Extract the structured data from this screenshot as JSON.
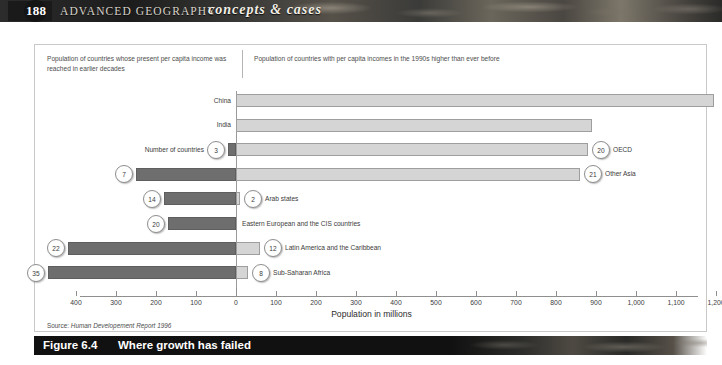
{
  "banner": {
    "page_number": "188",
    "title": "ADVANCED GEOGRAPHY",
    "subtitle": "concepts & cases"
  },
  "figure": {
    "caption_left": "Population of countries whose present per capita income was reached in earlier decades",
    "caption_right": "Population of countries with per capita incomes  in the 1990s higher than ever before",
    "axis_title": "Population in millions",
    "source_prefix": "Source: ",
    "source_title": "Human Developement Report 1996",
    "number_of_countries_label": "Number of countries",
    "fig_number": "Figure 6.4",
    "fig_title": "Where growth has failed"
  },
  "chart_data": {
    "type": "bar",
    "orientation": "horizontal",
    "style": "diverging",
    "title": "Where growth has failed",
    "xlabel": "Population in millions",
    "ylabel": "",
    "xlim": [
      -470,
      1230
    ],
    "xticks": [
      -400,
      -300,
      -200,
      -100,
      0,
      100,
      200,
      300,
      400,
      500,
      600,
      700,
      800,
      900,
      1000,
      1100,
      1200
    ],
    "xticklabels": [
      "400",
      "300",
      "200",
      "100",
      "0",
      "100",
      "200",
      "300",
      "400",
      "500",
      "600",
      "700",
      "800",
      "900",
      "1,000",
      "1,100",
      "1,200"
    ],
    "grid": false,
    "legend": "none",
    "series": [
      {
        "name": "Population of countries whose present per capita income was reached in earlier decades",
        "side": "left",
        "color": "#6e6e6e",
        "values": [
          0,
          0,
          -20,
          -250,
          -180,
          -170,
          -420,
          -470
        ]
      },
      {
        "name": "Population of countries with per capita incomes in the 1990s higher than ever before",
        "side": "right",
        "color": "#d5d5d5",
        "values": [
          1195,
          890,
          880,
          860,
          10,
          0,
          60,
          30
        ]
      }
    ],
    "categories": [
      "China",
      "India",
      "OECD",
      "Other Asia",
      "Arab states",
      "Eastern European and the CIS countries",
      "Latin America and the Caribbean",
      "Sub-Saharan Africa"
    ],
    "country_counts_left": [
      null,
      null,
      3,
      7,
      14,
      20,
      22,
      35
    ],
    "country_counts_right": [
      null,
      null,
      20,
      21,
      2,
      null,
      12,
      8
    ]
  },
  "rows": [
    {
      "label": "China",
      "label_side": "left-of-axis",
      "left_value": 0,
      "right_value": 1195,
      "left_count": null,
      "right_count": null
    },
    {
      "label": "India",
      "label_side": "left-of-axis",
      "left_value": 0,
      "right_value": 890,
      "left_count": null,
      "right_count": null
    },
    {
      "label": "OECD",
      "label_side": "right",
      "left_value": -20,
      "right_value": 880,
      "left_count": "3",
      "right_count": "20"
    },
    {
      "label": "Other Asia",
      "label_side": "right",
      "left_value": -250,
      "right_value": 860,
      "left_count": "7",
      "right_count": "21"
    },
    {
      "label": "Arab states",
      "label_side": "right",
      "left_value": -180,
      "right_value": 10,
      "left_count": "14",
      "right_count": "2"
    },
    {
      "label": "Eastern European and the CIS countries",
      "label_side": "right",
      "left_value": -170,
      "right_value": 0,
      "left_count": "20",
      "right_count": null
    },
    {
      "label": "Latin America and the Caribbean",
      "label_side": "right",
      "left_value": -420,
      "right_value": 60,
      "left_count": "22",
      "right_count": "12"
    },
    {
      "label": "Sub-Saharan Africa",
      "label_side": "right",
      "left_value": -470,
      "right_value": 30,
      "left_count": "35",
      "right_count": "8"
    }
  ],
  "colors": {
    "bar_left": "#6e6e6e",
    "bar_right": "#d5d5d5",
    "axis": "#8f8f8f",
    "banner_dark": "#1a1a1a"
  }
}
